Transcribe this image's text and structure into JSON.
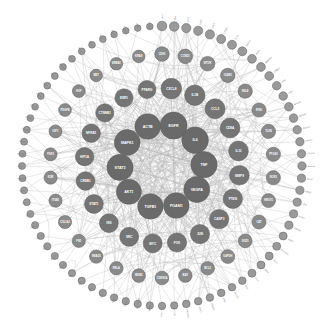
{
  "figure": {
    "type": "concentric-ring-network",
    "width": 324,
    "height": 333,
    "background_color": "#ffffff",
    "center": [
      162,
      166
    ]
  },
  "style": {
    "edge_color": "#b9b9b9",
    "edge_width": 0.45,
    "edge_opacity": 0.72,
    "node_stroke": "#5a5a5a",
    "label_color_inside": "#ffffff",
    "label_color_outside": "#777777",
    "hub_fill": "#6a6a6a",
    "mid_fill": "#7d7d7d",
    "outer_fill": "#8f8f8f",
    "faint_fill": "#b5b5b5"
  },
  "chart_data": {
    "type": "scatter",
    "xlabel": "",
    "ylabel": "",
    "layout": "concentric",
    "rings": [
      {
        "name": "hub",
        "radius": 42,
        "count": 10,
        "node_radius": 12.5,
        "fill": "#6a6a6a",
        "label_size": 3.6
      },
      {
        "name": "inner",
        "radius": 78,
        "count": 20,
        "node_radius": 9.5,
        "fill": "#757575",
        "label_size": 3.1
      },
      {
        "name": "middle",
        "radius": 112,
        "count": 30,
        "node_radius": 6.8,
        "fill": "#8a8a8a",
        "label_size": 2.6
      },
      {
        "name": "outer",
        "radius": 140,
        "count": 72,
        "node_radius": 4.4,
        "fill": "#9a9a9a",
        "label_size": 2.2
      }
    ],
    "nodes": [
      {
        "id": "EGFR",
        "ring": 0,
        "index": 0,
        "degree": 96,
        "label_inside": true
      },
      {
        "id": "IL6",
        "ring": 0,
        "index": 1,
        "degree": 92,
        "label_inside": true
      },
      {
        "id": "TNF",
        "ring": 0,
        "index": 2,
        "degree": 90,
        "label_inside": true
      },
      {
        "id": "VEGFA",
        "ring": 0,
        "index": 3,
        "degree": 86,
        "label_inside": true
      },
      {
        "id": "PGAM1",
        "ring": 0,
        "index": 4,
        "degree": 80,
        "label_inside": true
      },
      {
        "id": "TGFB1",
        "ring": 0,
        "index": 5,
        "degree": 78,
        "label_inside": true
      },
      {
        "id": "AKT1",
        "ring": 0,
        "index": 6,
        "degree": 74,
        "label_inside": true
      },
      {
        "id": "STAT3",
        "ring": 0,
        "index": 7,
        "degree": 88,
        "label_inside": true
      },
      {
        "id": "MAPK1",
        "ring": 0,
        "index": 8,
        "degree": 84,
        "label_inside": true
      },
      {
        "id": "ACTB",
        "ring": 0,
        "index": 9,
        "degree": 82,
        "label_inside": true
      },
      {
        "id": "CXCL8",
        "ring": 1,
        "index": 0,
        "degree": 64,
        "label_inside": true
      },
      {
        "id": "IL1B",
        "ring": 1,
        "index": 1,
        "degree": 62,
        "label_inside": true
      },
      {
        "id": "CCL2",
        "ring": 1,
        "index": 2,
        "degree": 60,
        "label_inside": true
      },
      {
        "id": "CD8A",
        "ring": 1,
        "index": 3,
        "degree": 58,
        "label_inside": true
      },
      {
        "id": "IL10",
        "ring": 1,
        "index": 4,
        "degree": 57,
        "label_inside": true
      },
      {
        "id": "MMP9",
        "ring": 1,
        "index": 5,
        "degree": 56,
        "label_inside": true
      },
      {
        "id": "PTEN",
        "ring": 1,
        "index": 6,
        "degree": 54,
        "label_inside": true
      },
      {
        "id": "CASP3",
        "ring": 1,
        "index": 7,
        "degree": 53,
        "label_inside": true
      },
      {
        "id": "JUN",
        "ring": 1,
        "index": 8,
        "degree": 52,
        "label_inside": true
      },
      {
        "id": "FOS",
        "ring": 1,
        "index": 9,
        "degree": 51,
        "label_inside": true
      },
      {
        "id": "MYC",
        "ring": 1,
        "index": 10,
        "degree": 50,
        "label_inside": true
      },
      {
        "id": "SRC",
        "ring": 1,
        "index": 11,
        "degree": 49,
        "label_inside": true
      },
      {
        "id": "INS",
        "ring": 1,
        "index": 12,
        "degree": 48,
        "label_inside": true
      },
      {
        "id": "STAT1",
        "ring": 1,
        "index": 13,
        "degree": 47,
        "label_inside": true
      },
      {
        "id": "CREB1",
        "ring": 1,
        "index": 14,
        "degree": 46,
        "label_inside": true
      },
      {
        "id": "HIF1A",
        "ring": 1,
        "index": 15,
        "degree": 45,
        "label_inside": true
      },
      {
        "id": "NFKB1",
        "ring": 1,
        "index": 16,
        "degree": 44,
        "label_inside": true
      },
      {
        "id": "CTNNB1",
        "ring": 1,
        "index": 17,
        "degree": 43,
        "label_inside": true
      },
      {
        "id": "ESR1",
        "ring": 1,
        "index": 18,
        "degree": 42,
        "label_inside": true
      },
      {
        "id": "PPARG",
        "ring": 1,
        "index": 19,
        "degree": 41,
        "label_inside": true
      },
      {
        "id": "CDH1",
        "ring": 2,
        "index": 0,
        "degree": 34
      },
      {
        "id": "CCND1",
        "ring": 2,
        "index": 1,
        "degree": 33
      },
      {
        "id": "MTOR",
        "ring": 2,
        "index": 2,
        "degree": 33
      },
      {
        "id": "ICAM1",
        "ring": 2,
        "index": 3,
        "degree": 32
      },
      {
        "id": "SELE",
        "ring": 2,
        "index": 4,
        "degree": 32
      },
      {
        "id": "IFNG",
        "ring": 2,
        "index": 5,
        "degree": 31
      },
      {
        "id": "TLR4",
        "ring": 2,
        "index": 6,
        "degree": 31
      },
      {
        "id": "PTGS2",
        "ring": 2,
        "index": 7,
        "degree": 30
      },
      {
        "id": "NOS3",
        "ring": 2,
        "index": 8,
        "degree": 30
      },
      {
        "id": "HMOX1",
        "ring": 2,
        "index": 9,
        "degree": 29
      },
      {
        "id": "CAT",
        "ring": 2,
        "index": 10,
        "degree": 29
      },
      {
        "id": "SOD1",
        "ring": 2,
        "index": 11,
        "degree": 28
      },
      {
        "id": "GAPDH",
        "ring": 2,
        "index": 12,
        "degree": 28
      },
      {
        "id": "BCL2",
        "ring": 2,
        "index": 13,
        "degree": 27
      },
      {
        "id": "BAX",
        "ring": 2,
        "index": 14,
        "degree": 27
      },
      {
        "id": "CDKN1A",
        "ring": 2,
        "index": 15,
        "degree": 26
      },
      {
        "id": "MDM2",
        "ring": 2,
        "index": 16,
        "degree": 26
      },
      {
        "id": "RELA",
        "ring": 2,
        "index": 17,
        "degree": 25
      },
      {
        "id": "SMAD3",
        "ring": 2,
        "index": 18,
        "degree": 25
      },
      {
        "id": "FN1",
        "ring": 2,
        "index": 19,
        "degree": 24
      },
      {
        "id": "COL1A1",
        "ring": 2,
        "index": 20,
        "degree": 24
      },
      {
        "id": "ITGB1",
        "ring": 2,
        "index": 21,
        "degree": 23
      },
      {
        "id": "KDR",
        "ring": 2,
        "index": 22,
        "degree": 23
      },
      {
        "id": "FGF2",
        "ring": 2,
        "index": 23,
        "degree": 22
      },
      {
        "id": "IGF1",
        "ring": 2,
        "index": 24,
        "degree": 22
      },
      {
        "id": "PDGFB",
        "ring": 2,
        "index": 25,
        "degree": 21
      },
      {
        "id": "HGF",
        "ring": 2,
        "index": 26,
        "degree": 21
      },
      {
        "id": "MET",
        "ring": 2,
        "index": 27,
        "degree": 20
      },
      {
        "id": "ERBB2",
        "ring": 2,
        "index": 28,
        "degree": 20
      },
      {
        "id": "KRAS",
        "ring": 2,
        "index": 29,
        "degree": 19
      },
      {
        "id": "TP53",
        "ring": 3,
        "index": 0,
        "degree": 14
      },
      {
        "id": "RB1",
        "ring": 3,
        "index": 1,
        "degree": 14
      },
      {
        "id": "E2F1",
        "ring": 3,
        "index": 2,
        "degree": 13
      },
      {
        "id": "CDK2",
        "ring": 3,
        "index": 3,
        "degree": 13
      },
      {
        "id": "CDK4",
        "ring": 3,
        "index": 4,
        "degree": 13
      },
      {
        "id": "CCNB1",
        "ring": 3,
        "index": 5,
        "degree": 12
      },
      {
        "id": "PLK1",
        "ring": 3,
        "index": 6,
        "degree": 12
      },
      {
        "id": "AURKA",
        "ring": 3,
        "index": 7,
        "degree": 12
      },
      {
        "id": "BUB1",
        "ring": 3,
        "index": 8,
        "degree": 11
      },
      {
        "id": "MAD2L1",
        "ring": 3,
        "index": 9,
        "degree": 11
      },
      {
        "id": "CHEK1",
        "ring": 3,
        "index": 10,
        "degree": 11
      },
      {
        "id": "ATM",
        "ring": 3,
        "index": 11,
        "degree": 10
      },
      {
        "id": "ATR",
        "ring": 3,
        "index": 12,
        "degree": 10
      },
      {
        "id": "BRCA1",
        "ring": 3,
        "index": 13,
        "degree": 10
      },
      {
        "id": "BRCA2",
        "ring": 3,
        "index": 14,
        "degree": 10
      },
      {
        "id": "RAD51",
        "ring": 3,
        "index": 15,
        "degree": 9
      },
      {
        "id": "PARP1",
        "ring": 3,
        "index": 16,
        "degree": 9
      },
      {
        "id": "XRCC1",
        "ring": 3,
        "index": 17,
        "degree": 9
      },
      {
        "id": "ERCC1",
        "ring": 3,
        "index": 18,
        "degree": 9
      },
      {
        "id": "MLH1",
        "ring": 3,
        "index": 19,
        "degree": 8
      },
      {
        "id": "MSH2",
        "ring": 3,
        "index": 20,
        "degree": 8
      },
      {
        "id": "APC",
        "ring": 3,
        "index": 21,
        "degree": 8
      },
      {
        "id": "AXIN1",
        "ring": 3,
        "index": 22,
        "degree": 8
      },
      {
        "id": "GSK3B",
        "ring": 3,
        "index": 23,
        "degree": 8
      },
      {
        "id": "WNT1",
        "ring": 3,
        "index": 24,
        "degree": 7
      },
      {
        "id": "NOTCH1",
        "ring": 3,
        "index": 25,
        "degree": 7
      },
      {
        "id": "JAG1",
        "ring": 3,
        "index": 26,
        "degree": 7
      },
      {
        "id": "HES1",
        "ring": 3,
        "index": 27,
        "degree": 7
      },
      {
        "id": "SHH",
        "ring": 3,
        "index": 28,
        "degree": 7
      },
      {
        "id": "GLI1",
        "ring": 3,
        "index": 29,
        "degree": 6
      },
      {
        "id": "PTCH1",
        "ring": 3,
        "index": 30,
        "degree": 6
      },
      {
        "id": "SMO",
        "ring": 3,
        "index": 31,
        "degree": 6
      },
      {
        "id": "FOXO3",
        "ring": 3,
        "index": 32,
        "degree": 6
      },
      {
        "id": "SIRT1",
        "ring": 3,
        "index": 33,
        "degree": 6
      },
      {
        "id": "PRKAA1",
        "ring": 3,
        "index": 34,
        "degree": 6
      },
      {
        "id": "ULK1",
        "ring": 3,
        "index": 35,
        "degree": 5
      },
      {
        "id": "ATG5",
        "ring": 3,
        "index": 36,
        "degree": 5
      },
      {
        "id": "BECN1",
        "ring": 3,
        "index": 37,
        "degree": 5
      },
      {
        "id": "MAP1LC3B",
        "ring": 3,
        "index": 38,
        "degree": 5
      },
      {
        "id": "SQSTM1",
        "ring": 3,
        "index": 39,
        "degree": 5
      },
      {
        "id": "NFE2L2",
        "ring": 3,
        "index": 40,
        "degree": 5
      },
      {
        "id": "KEAP1",
        "ring": 3,
        "index": 41,
        "degree": 5
      },
      {
        "id": "GPX1",
        "ring": 3,
        "index": 42,
        "degree": 4
      },
      {
        "id": "GSR",
        "ring": 3,
        "index": 43,
        "degree": 4
      },
      {
        "id": "TXN",
        "ring": 3,
        "index": 44,
        "degree": 4
      },
      {
        "id": "PRDX1",
        "ring": 3,
        "index": 45,
        "degree": 4
      },
      {
        "id": "NQO1",
        "ring": 3,
        "index": 46,
        "degree": 4
      },
      {
        "id": "GCLC",
        "ring": 3,
        "index": 47,
        "degree": 4
      },
      {
        "id": "SLC7A11",
        "ring": 3,
        "index": 48,
        "degree": 4
      },
      {
        "id": "ACSL4",
        "ring": 3,
        "index": 49,
        "degree": 4
      },
      {
        "id": "GPX4",
        "ring": 3,
        "index": 50,
        "degree": 3
      },
      {
        "id": "FTH1",
        "ring": 3,
        "index": 51,
        "degree": 3
      },
      {
        "id": "TFRC",
        "ring": 3,
        "index": 52,
        "degree": 3
      },
      {
        "id": "HMGB1",
        "ring": 3,
        "index": 53,
        "degree": 3
      },
      {
        "id": "AGER",
        "ring": 3,
        "index": 54,
        "degree": 3
      },
      {
        "id": "MYD88",
        "ring": 3,
        "index": 55,
        "degree": 3
      },
      {
        "id": "IRAK4",
        "ring": 3,
        "index": 56,
        "degree": 3
      },
      {
        "id": "TRAF6",
        "ring": 3,
        "index": 57,
        "degree": 3
      },
      {
        "id": "IKBKB",
        "ring": 3,
        "index": 58,
        "degree": 2
      },
      {
        "id": "NFKBIA",
        "ring": 3,
        "index": 59,
        "degree": 2
      },
      {
        "id": "CHUK",
        "ring": 3,
        "index": 60,
        "degree": 2
      },
      {
        "id": "TBK1",
        "ring": 3,
        "index": 61,
        "degree": 2
      },
      {
        "id": "IRF3",
        "ring": 3,
        "index": 62,
        "degree": 2
      },
      {
        "id": "STING1",
        "ring": 3,
        "index": 63,
        "degree": 2
      },
      {
        "id": "CGAS",
        "ring": 3,
        "index": 64,
        "degree": 2
      },
      {
        "id": "IFNB1",
        "ring": 3,
        "index": 65,
        "degree": 2
      },
      {
        "id": "ISG15",
        "ring": 3,
        "index": 66,
        "degree": 2
      },
      {
        "id": "MX1",
        "ring": 3,
        "index": 67,
        "degree": 2
      },
      {
        "id": "OAS1",
        "ring": 3,
        "index": 68,
        "degree": 1
      },
      {
        "id": "RSAD2",
        "ring": 3,
        "index": 69,
        "degree": 1
      },
      {
        "id": "IFIT1",
        "ring": 3,
        "index": 70,
        "degree": 1
      },
      {
        "id": "DDX58",
        "ring": 3,
        "index": 71,
        "degree": 1
      }
    ]
  }
}
